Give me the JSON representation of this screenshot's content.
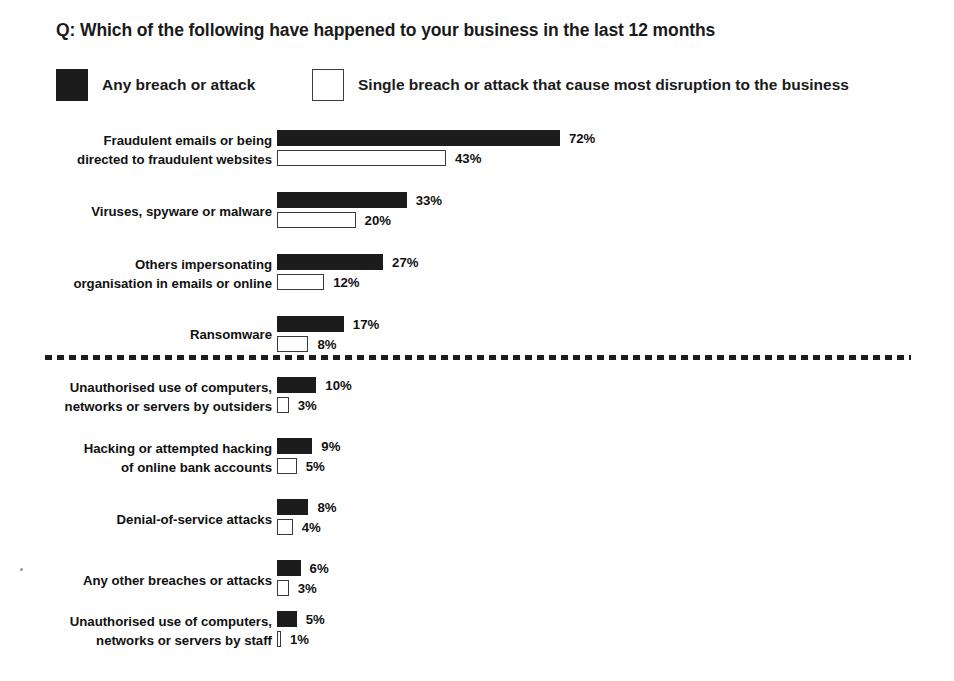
{
  "title": "Q: Which of the following have happened to your business in the last 12 months",
  "legend": {
    "items": [
      {
        "key": "any",
        "label": "Any breach or attack",
        "swatch": "filled-square-icon",
        "color": "#1c1c1c"
      },
      {
        "key": "single",
        "label": "Single breach or attack that cause most disruption to the business",
        "swatch": "hollow-square-icon",
        "color": "#ffffff"
      }
    ]
  },
  "divider": {
    "style": "dashed",
    "after_row_index": 3
  },
  "chart_data": {
    "type": "bar",
    "orientation": "horizontal",
    "title": "Q: Which of the following have happened to your business in the last 12 months",
    "xlabel": "",
    "ylabel": "",
    "xlim": [
      0,
      100
    ],
    "grid": false,
    "legend_position": "top",
    "value_suffix": "%",
    "categories": [
      "Fraudulent emails or being directed to fraudulent websites",
      "Viruses, spyware or malware",
      "Others impersonating organisation in emails or online",
      "Ransomware",
      "Unauthorised use of computers, networks or servers by outsiders",
      "Hacking or attempted hacking of online bank accounts",
      "Denial-of-service attacks",
      "Any other breaches or attacks",
      "Unauthorised use of computers, networks or servers by staff"
    ],
    "category_lines": [
      [
        "Fraudulent emails or being",
        "directed to fraudulent websites"
      ],
      [
        "Viruses, spyware or malware"
      ],
      [
        "Others impersonating",
        "organisation in emails or online"
      ],
      [
        "Ransomware"
      ],
      [
        "Unauthorised use of computers,",
        "networks or servers by outsiders"
      ],
      [
        "Hacking or attempted hacking",
        "of online bank accounts"
      ],
      [
        "Denial-of-service attacks"
      ],
      [
        "Any other breaches or attacks"
      ],
      [
        "Unauthorised use of computers,",
        "networks or servers by staff"
      ]
    ],
    "series": [
      {
        "name": "Any breach or attack",
        "values": [
          72,
          33,
          27,
          17,
          10,
          9,
          8,
          6,
          5
        ],
        "labels": [
          "72%",
          "33%",
          "27%",
          "17%",
          "10%",
          "9%",
          "8%",
          "6%",
          "5%"
        ]
      },
      {
        "name": "Single breach or attack that cause most disruption to the business",
        "values": [
          43,
          20,
          12,
          8,
          3,
          5,
          4,
          3,
          1
        ],
        "labels": [
          "43%",
          "20%",
          "12%",
          "8%",
          "3%",
          "5%",
          "4%",
          "3%",
          "1%"
        ]
      }
    ]
  }
}
